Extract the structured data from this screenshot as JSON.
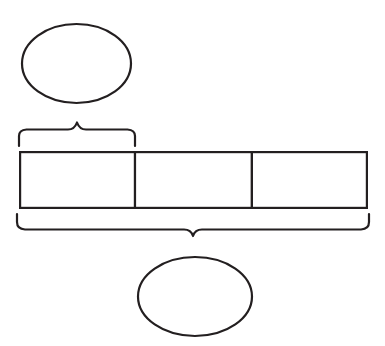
{
  "diagram": {
    "type": "tape-diagram",
    "title": "",
    "canvas": {
      "width": 385,
      "height": 346,
      "background": "#ffffff"
    },
    "line_color": "#231f20",
    "fill_color": "#ffffff",
    "bar": {
      "x": 19,
      "y": 151,
      "width": 349,
      "height": 58,
      "cell_count": 3,
      "divider_x": [
        135,
        252
      ],
      "cells": [
        {
          "label": "",
          "x": 19,
          "width": 116
        },
        {
          "label": "",
          "x": 135,
          "width": 117
        },
        {
          "label": "",
          "x": 252,
          "width": 116
        }
      ]
    },
    "braces": [
      {
        "name": "top-brace",
        "orientation": "up",
        "start_x": 19,
        "end_x": 135,
        "tip_x": 77,
        "tip_y": 122,
        "base_y": 146,
        "spans_cells": 1,
        "label": ""
      },
      {
        "name": "bottom-brace",
        "orientation": "down",
        "start_x": 17,
        "end_x": 369,
        "tip_x": 193,
        "tip_y": 234,
        "base_y": 214,
        "spans_cells": 3,
        "label": ""
      }
    ],
    "ellipses": [
      {
        "name": "top-ellipse",
        "cx": 76.5,
        "cy": 63.5,
        "rx": 54.5,
        "ry": 39.5,
        "label": ""
      },
      {
        "name": "bottom-ellipse",
        "cx": 195,
        "cy": 296.5,
        "rx": 57,
        "ry": 39.5,
        "label": ""
      }
    ]
  }
}
